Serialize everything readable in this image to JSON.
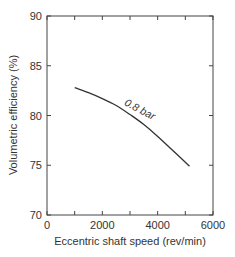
{
  "chart_data": {
    "type": "line",
    "title": "",
    "xlabel": "Eccentric shaft speed (rev/min)",
    "ylabel": "Volumetric efficiency (%)",
    "xlim": [
      0,
      6000
    ],
    "ylim": [
      70,
      90
    ],
    "xticks": [
      0,
      2000,
      4000,
      6000
    ],
    "xtick_labels": [
      "0",
      "2000",
      "4000",
      "6000"
    ],
    "yticks": [
      70,
      75,
      80,
      85,
      90
    ],
    "ytick_labels": [
      "70",
      "75",
      "80",
      "85",
      "90"
    ],
    "grid": false,
    "legend": null,
    "series": [
      {
        "name": "0.8 bar",
        "x": [
          1000,
          1500,
          2000,
          2500,
          3000,
          3500,
          4000,
          4500,
          5000,
          5150
        ],
        "y": [
          82.8,
          82.3,
          81.7,
          81.0,
          80.1,
          79.1,
          77.9,
          76.6,
          75.3,
          74.9
        ],
        "color": "#333333"
      }
    ],
    "annotations": [
      {
        "text": "0.8 bar",
        "x": 3300,
        "y": 80.3,
        "rotation": 28
      }
    ]
  }
}
